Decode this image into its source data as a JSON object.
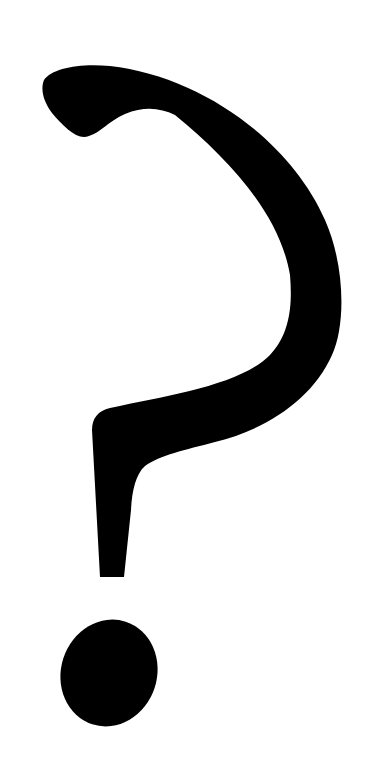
{
  "figure": {
    "glyph": "?",
    "icon": "question-mark-icon",
    "colors": {
      "foreground": "#000000",
      "background": "#ffffff"
    }
  }
}
